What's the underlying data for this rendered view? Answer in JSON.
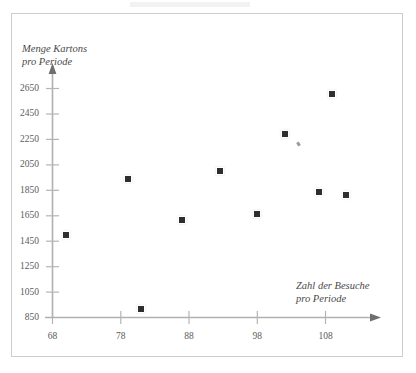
{
  "chart_data": {
    "type": "scatter",
    "title": "",
    "ylabel": "Menge Kartons pro Periode",
    "xlabel": "Zahl der Besuche pro Periode",
    "ylabel_line1": "Menge Kartons",
    "ylabel_line2": "pro Periode",
    "xlabel_line1": "Zahl der Besuche",
    "xlabel_line2": "pro Periode",
    "xlim": [
      68,
      113
    ],
    "ylim": [
      850,
      2750
    ],
    "xticks": [
      68,
      78,
      88,
      98,
      108
    ],
    "yticks": [
      850,
      1050,
      1250,
      1450,
      1650,
      1850,
      2050,
      2250,
      2450,
      2650
    ],
    "grid": false,
    "legend": null,
    "marker": "square",
    "marker_color": "#2e2e2e",
    "points": [
      {
        "x": 70,
        "y": 1495
      },
      {
        "x": 79,
        "y": 1935
      },
      {
        "x": 81,
        "y": 920
      },
      {
        "x": 87,
        "y": 1620
      },
      {
        "x": 92.5,
        "y": 2000
      },
      {
        "x": 98,
        "y": 1665
      },
      {
        "x": 102,
        "y": 2295
      },
      {
        "x": 107,
        "y": 1835
      },
      {
        "x": 109,
        "y": 2605
      },
      {
        "x": 111,
        "y": 1815
      }
    ],
    "annotations": [
      {
        "name": "scan-speck",
        "x": 104,
        "y": 2215
      }
    ]
  },
  "axis": {
    "x_tick_labels": [
      "68",
      "78",
      "88",
      "98",
      "108"
    ],
    "y_tick_labels": [
      "2650",
      "2450",
      "2250",
      "2050",
      "1850",
      "1650",
      "1450",
      "1250",
      "1050",
      "850"
    ]
  }
}
